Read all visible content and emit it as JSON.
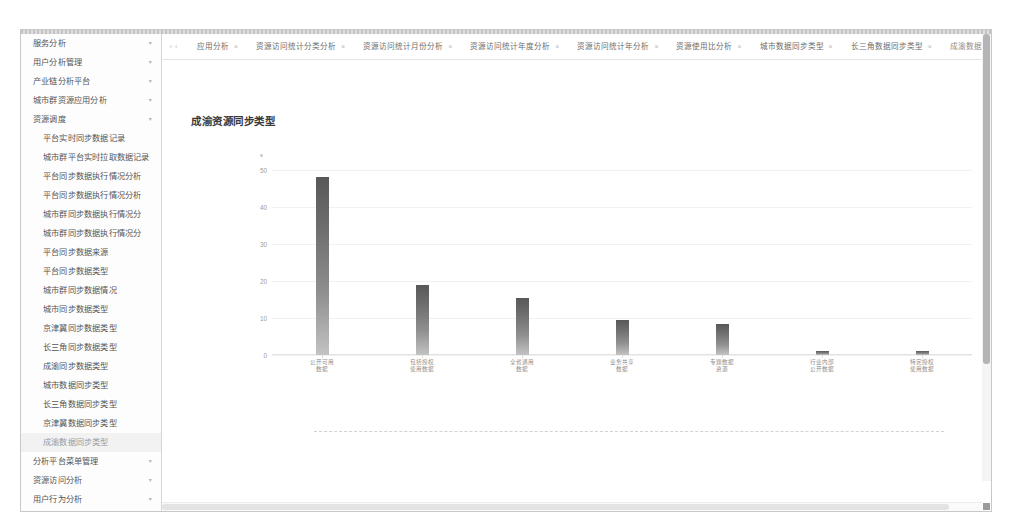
{
  "app": {
    "title": "成渝资源同步类型"
  },
  "sidebar": {
    "items": [
      {
        "label": "服务分析",
        "level": 1,
        "caret": "▾",
        "active": false
      },
      {
        "label": "用户分析管理",
        "level": 1,
        "caret": "▾",
        "active": false
      },
      {
        "label": "产业链分析平台",
        "level": 1,
        "caret": "▾",
        "active": false
      },
      {
        "label": "城市群资源应用分析",
        "level": 1,
        "caret": "▾",
        "active": false
      },
      {
        "label": "资源调度",
        "level": 1,
        "caret": "▾",
        "active": false
      },
      {
        "label": "平台实时同步数据记录",
        "level": 2,
        "caret": "",
        "active": false
      },
      {
        "label": "城市群平台实时拉取数据记录",
        "level": 2,
        "caret": "",
        "active": false
      },
      {
        "label": "平台同步数据执行情况分析",
        "level": 2,
        "caret": "",
        "active": false
      },
      {
        "label": "平台同步数据执行情况分析",
        "level": 2,
        "caret": "",
        "active": false
      },
      {
        "label": "城市群同步数据执行情况分",
        "level": 2,
        "caret": "",
        "active": false
      },
      {
        "label": "城市群同步数据执行情况分",
        "level": 2,
        "caret": "",
        "active": false
      },
      {
        "label": "平台同步数据来源",
        "level": 2,
        "caret": "",
        "active": false
      },
      {
        "label": "平台同步数据类型",
        "level": 2,
        "caret": "",
        "active": false
      },
      {
        "label": "城市群同步数据情况",
        "level": 2,
        "caret": "",
        "active": false
      },
      {
        "label": "城市同步数据类型",
        "level": 2,
        "caret": "",
        "active": false
      },
      {
        "label": "京津冀同步数据类型",
        "level": 2,
        "caret": "",
        "active": false
      },
      {
        "label": "长三角同步数据类型",
        "level": 2,
        "caret": "",
        "active": false
      },
      {
        "label": "成渝同步数据类型",
        "level": 2,
        "caret": "",
        "active": false
      },
      {
        "label": "城市数据同步类型",
        "level": 2,
        "caret": "",
        "active": false
      },
      {
        "label": "长三角数据同步类型",
        "level": 2,
        "caret": "",
        "active": false
      },
      {
        "label": "京津冀数据同步类型",
        "level": 2,
        "caret": "",
        "active": false
      },
      {
        "label": "成渝数据同步类型",
        "level": 2,
        "caret": "",
        "active": true
      },
      {
        "label": "分析平台菜单管理",
        "level": 1,
        "caret": "▾",
        "active": false
      },
      {
        "label": "资源访问分析",
        "level": 1,
        "caret": "▾",
        "active": false
      },
      {
        "label": "用户行为分析",
        "level": 1,
        "caret": "▾",
        "active": false
      },
      {
        "label": "用户访问实时分析",
        "level": 1,
        "caret": "▾",
        "active": false
      },
      {
        "label": "热点资源分析",
        "level": 1,
        "caret": "▾",
        "active": false
      },
      {
        "label": "多平台用户融合",
        "level": 1,
        "caret": "▾",
        "active": false
      },
      {
        "label": "服务请求内容安全分析",
        "level": 1,
        "caret": "▾",
        "active": false
      }
    ]
  },
  "tabbar": {
    "nav_left": "‹‹",
    "nav_right": "‹",
    "close_glyph": "×",
    "caret_glyph": "▾",
    "tabs": [
      {
        "label": "应用分析",
        "closable": true,
        "current": false
      },
      {
        "label": "资源访问统计分类分析",
        "closable": true,
        "current": false
      },
      {
        "label": "资源访问统计月份分析",
        "closable": true,
        "current": false
      },
      {
        "label": "资源访问统计年度分析",
        "closable": true,
        "current": false
      },
      {
        "label": "资源访问统计年分析",
        "closable": true,
        "current": false
      },
      {
        "label": "资源使用比分析",
        "closable": true,
        "current": false
      },
      {
        "label": "城市数据同步类型",
        "closable": true,
        "current": false
      },
      {
        "label": "长三角数据同步类型",
        "closable": true,
        "current": false
      },
      {
        "label": "成渝数据同步类型",
        "closable": true,
        "current": true
      }
    ],
    "more_label": "更多"
  },
  "chart_data": {
    "type": "bar",
    "title": "成渝资源同步类型",
    "xlabel": "",
    "ylabel": "",
    "ylim": [
      0,
      50
    ],
    "yticks": [
      0,
      10,
      20,
      30,
      40,
      50
    ],
    "grid": true,
    "legend": "none",
    "categories": [
      "公开可用\n数据",
      "包括授权\n使用数据",
      "全省通用\n数据",
      "业务共享\n数据",
      "专题数据\n资源",
      "行业内部\n公开数据",
      "特定授权\n使用数据"
    ],
    "values": [
      48,
      19,
      15.5,
      9.5,
      8.5,
      1,
      1
    ]
  },
  "footer": {
    "divider": "dashed-rule"
  }
}
